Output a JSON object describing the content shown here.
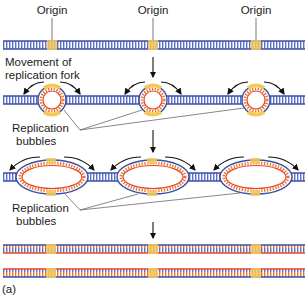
{
  "colors": {
    "parent_strand": "#3a4fa8",
    "new_strand": "#e8452c",
    "origin": "#f5c85a",
    "rung_parent": "#5b6fc4",
    "label": "#222222",
    "arrow": "#111111",
    "leader": "#555555"
  },
  "labels": {
    "origin_1": "Origin",
    "origin_2": "Origin",
    "origin_3": "Origin",
    "movement_line1": "Movement of",
    "movement_line2": "replication fork",
    "bubbles1_line1": "Replication",
    "bubbles1_line2": "bubbles",
    "bubbles2_line1": "Replication",
    "bubbles2_line2": "bubbles",
    "panel": "(a)"
  },
  "stages": [
    {
      "name": "unreplicated-dna",
      "y": 45
    },
    {
      "name": "small-bubbles",
      "y": 100
    },
    {
      "name": "large-bubbles",
      "y": 177
    },
    {
      "name": "daughter-duplex-1",
      "y": 249
    },
    {
      "name": "daughter-duplex-2",
      "y": 273
    }
  ],
  "origins_x": [
    52,
    153,
    256
  ]
}
